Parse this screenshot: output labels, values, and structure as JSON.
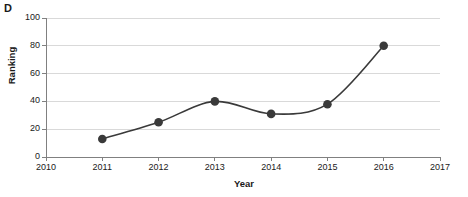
{
  "panel": {
    "label": "D"
  },
  "chart_data": {
    "type": "line",
    "title": "",
    "xlabel": "Year",
    "ylabel": "Ranking",
    "x": [
      2011,
      2012,
      2013,
      2014,
      2015,
      2016
    ],
    "values": [
      13,
      25,
      40,
      31,
      38,
      80
    ],
    "series": [
      {
        "name": "Ranking",
        "x": [
          2011,
          2012,
          2013,
          2014,
          2015,
          2016
        ],
        "values": [
          13,
          25,
          40,
          31,
          38,
          80
        ]
      }
    ],
    "xlim": [
      2010,
      2017
    ],
    "ylim": [
      0,
      100
    ],
    "xticks": [
      "2010",
      "2011",
      "2012",
      "2013",
      "2014",
      "2015",
      "2016",
      "2017"
    ],
    "yticks": [
      "0",
      "20",
      "40",
      "60",
      "80",
      "100"
    ],
    "grid": "horizontal",
    "legend": "none",
    "marker": "circle",
    "line_style": "smooth",
    "colors": {
      "line": "#3a3a3a",
      "marker": "#3a3a3a",
      "grid": "#d9d9d9",
      "axis": "#808080",
      "text": "#1a1a1a"
    }
  }
}
